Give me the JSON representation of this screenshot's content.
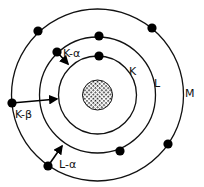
{
  "diagram": {
    "title": "",
    "type": "bohr-atom-xray-transitions",
    "center": [
      97.5,
      95
    ],
    "nucleus": {
      "radius": 15,
      "pattern": "cross-hatched"
    },
    "shells": [
      {
        "name": "K",
        "label": "K",
        "radius": 39,
        "label_pos": [
          129,
          75
        ]
      },
      {
        "name": "L",
        "label": "L",
        "radius": 58,
        "label_pos": [
          154,
          87
        ]
      },
      {
        "name": "M",
        "label": "M",
        "radius": 86,
        "label_pos": [
          185,
          97
        ]
      }
    ],
    "electrons": [
      {
        "shell": "K",
        "pos": [
          99,
          56
        ]
      },
      {
        "shell": "L",
        "pos": [
          99,
          36
        ]
      },
      {
        "shell": "L",
        "pos": [
          57,
          52
        ]
      },
      {
        "shell": "L",
        "pos": [
          120,
          151
        ]
      },
      {
        "shell": "M",
        "pos": [
          38,
          31
        ]
      },
      {
        "shell": "M",
        "pos": [
          152,
          28
        ]
      },
      {
        "shell": "M",
        "pos": [
          12,
          103
        ]
      },
      {
        "shell": "M",
        "pos": [
          168,
          144
        ]
      },
      {
        "shell": "M",
        "pos": [
          48,
          166
        ]
      }
    ],
    "transitions": [
      {
        "name": "K-alpha",
        "label": "K-α",
        "from": [
          57,
          52
        ],
        "to": [
          68,
          64
        ],
        "label_pos": [
          63,
          57
        ]
      },
      {
        "name": "K-beta",
        "label": "K-β",
        "from": [
          12,
          103
        ],
        "to": [
          57,
          99
        ],
        "label_pos": [
          15,
          118
        ]
      },
      {
        "name": "L-alpha",
        "label": "L-α",
        "from": [
          48,
          166
        ],
        "to": [
          62,
          146
        ],
        "label_pos": [
          59,
          168
        ]
      }
    ]
  }
}
